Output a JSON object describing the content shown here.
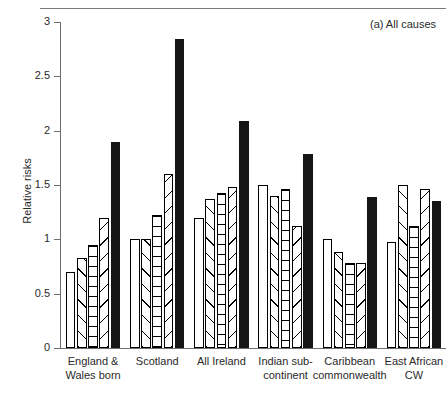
{
  "figure": {
    "panel_label": "(a) All causes",
    "y_axis_title": "Relative risks"
  },
  "chart_data": {
    "type": "bar",
    "title": "(a) All causes",
    "xlabel": "",
    "ylabel": "Relative risks",
    "ylim": [
      0,
      3
    ],
    "yticks": [
      0,
      0.5,
      1,
      1.5,
      2,
      2.5,
      3
    ],
    "ytick_labels": [
      "0",
      "0.5",
      "1",
      "1.5",
      "2",
      "2.5",
      "3"
    ],
    "grid": false,
    "legend": "none",
    "categories": [
      "England & Wales born",
      "Scotland",
      "All Ireland",
      "Indian sub-continent",
      "Caribbean commonwealth",
      "East African CW"
    ],
    "category_lines": [
      [
        "England &",
        "Wales born"
      ],
      [
        "Scotland",
        ""
      ],
      [
        "All Ireland",
        ""
      ],
      [
        "Indian sub-",
        "continent"
      ],
      [
        "Caribbean",
        "commonwealth"
      ],
      [
        "East African",
        "CW"
      ]
    ],
    "series": [
      {
        "name": "series-1",
        "fill": "white",
        "values": [
          0.7,
          1.0,
          1.2,
          1.5,
          1.0,
          0.98
        ]
      },
      {
        "name": "series-2",
        "fill": "diagonal-left",
        "values": [
          0.83,
          1.0,
          1.37,
          1.4,
          0.88,
          1.5
        ]
      },
      {
        "name": "series-3",
        "fill": "horizontal-lines",
        "values": [
          0.95,
          1.22,
          1.43,
          1.46,
          0.78,
          1.12
        ]
      },
      {
        "name": "series-4",
        "fill": "diagonal-right",
        "values": [
          1.2,
          1.6,
          1.48,
          1.12,
          0.78,
          1.46
        ]
      },
      {
        "name": "series-5",
        "fill": "black",
        "values": [
          1.9,
          2.84,
          2.09,
          1.79,
          1.39,
          1.35
        ]
      }
    ]
  }
}
